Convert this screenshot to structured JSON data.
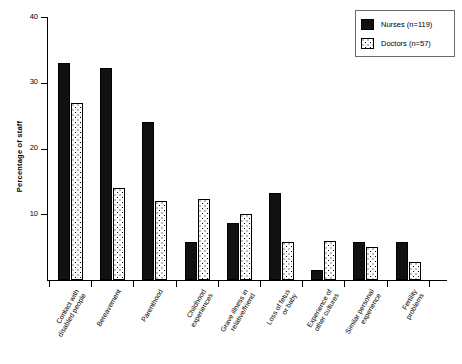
{
  "chart_data": {
    "type": "bar",
    "title": "",
    "xlabel": "",
    "ylabel": "Percentage of staff",
    "ylim": [
      0,
      40
    ],
    "yticks": [
      0,
      10,
      20,
      30,
      40
    ],
    "ytick_labels": [
      "",
      "10",
      "20",
      "30",
      "40"
    ],
    "grid": false,
    "legend_position": "top-right",
    "categories": [
      "Contact with\ndisabled people",
      "Bereavement",
      "Parenthood",
      "Childhood\nexperiences",
      "Grave illness in\nrelative/friend",
      "Loss of fetus\nor baby",
      "Experience of\nother cultures",
      "Similar personal\nexperience",
      "Fertility\nproblems"
    ],
    "series": [
      {
        "name": "Nurses (n=119)",
        "pattern": "solid-black",
        "color": "#111111",
        "values": [
          33.0,
          32.2,
          24.0,
          5.8,
          8.6,
          13.3,
          1.5,
          5.8,
          5.8
        ]
      },
      {
        "name": "Doctors (n=57)",
        "pattern": "dotted-white",
        "color": "#ffffff",
        "values": [
          26.9,
          14.0,
          12.0,
          12.3,
          10.0,
          5.8,
          6.0,
          5.0,
          2.8
        ]
      }
    ]
  },
  "legend": {
    "items": [
      {
        "label": "Nurses (n=119)"
      },
      {
        "label": "Doctors (n=57)"
      }
    ]
  }
}
